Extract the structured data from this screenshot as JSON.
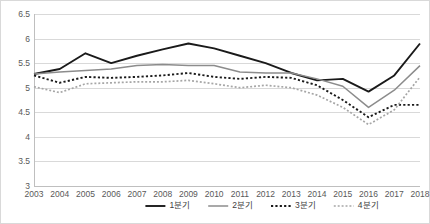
{
  "chart_data": {
    "type": "line",
    "title": "",
    "subtitle": "",
    "xlabel": "",
    "ylabel": "",
    "x": [
      "2003",
      "2004",
      "2005",
      "2006",
      "2007",
      "2008",
      "2009",
      "2010",
      "2011",
      "2012",
      "2013",
      "2014",
      "2015",
      "2016",
      "2017",
      "2018"
    ],
    "categories": [
      "2003",
      "2004",
      "2005",
      "2006",
      "2007",
      "2008",
      "2009",
      "2010",
      "2011",
      "2012",
      "2013",
      "2014",
      "2015",
      "2016",
      "2017",
      "2018"
    ],
    "ylim": [
      3,
      6.5
    ],
    "yticks": [
      "3",
      "3.5",
      "4",
      "4.5",
      "5",
      "5.5",
      "6",
      "6.5"
    ],
    "ytick_values": [
      3,
      3.5,
      4,
      4.5,
      5,
      5.5,
      6,
      6.5
    ],
    "grid": "horizontal",
    "legend_position": "bottom",
    "series": [
      {
        "name": "1분기",
        "style": "solid",
        "color": "#1a1a1a",
        "width": 1.9,
        "values": [
          5.28,
          5.38,
          5.7,
          5.5,
          5.65,
          5.78,
          5.9,
          5.8,
          5.65,
          5.5,
          5.3,
          5.15,
          5.18,
          4.92,
          5.25,
          5.9
        ]
      },
      {
        "name": "2분기",
        "style": "solid",
        "color": "#8c8c8c",
        "width": 1.5,
        "values": [
          5.28,
          5.32,
          5.35,
          5.38,
          5.45,
          5.47,
          5.45,
          5.45,
          5.32,
          5.3,
          5.3,
          5.18,
          5.03,
          4.6,
          4.95,
          5.45
        ]
      },
      {
        "name": "3분기",
        "style": "dotted",
        "color": "#1a1a1a",
        "width": 1.9,
        "values": [
          5.25,
          5.1,
          5.22,
          5.2,
          5.22,
          5.25,
          5.3,
          5.22,
          5.18,
          5.22,
          5.2,
          5.05,
          4.75,
          4.4,
          4.65,
          4.65
        ]
      },
      {
        "name": "4분기",
        "style": "dotted",
        "color": "#a6a6a6",
        "width": 1.7,
        "values": [
          5.02,
          4.9,
          5.08,
          5.1,
          5.12,
          5.12,
          5.15,
          5.08,
          5.0,
          5.05,
          5.0,
          4.85,
          4.6,
          4.25,
          4.55,
          5.22
        ]
      }
    ]
  },
  "legend": {
    "items": [
      {
        "label": "1분기",
        "style": "solid",
        "color": "#1a1a1a"
      },
      {
        "label": "2분기",
        "style": "solid",
        "color": "#8c8c8c"
      },
      {
        "label": "3분기",
        "style": "dotted",
        "color": "#1a1a1a"
      },
      {
        "label": "4분기",
        "style": "dotted",
        "color": "#a6a6a6"
      }
    ]
  },
  "colors": {
    "border": "#d9d9d9",
    "gridline": "#d9d9d9",
    "axis": "#bfbfbf",
    "tick_text": "#595959",
    "legend_text": "#404040",
    "background": "#ffffff"
  }
}
